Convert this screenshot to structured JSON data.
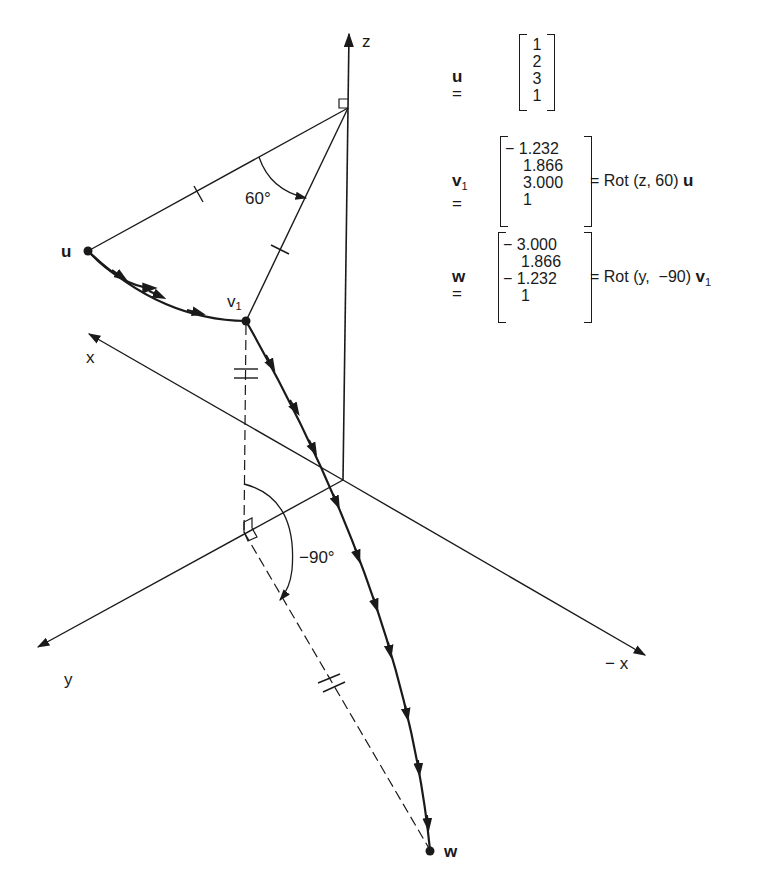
{
  "diagram": {
    "axes": {
      "z_label": "z",
      "x_label": "x",
      "neg_x_label": "− x",
      "y_label": "y"
    },
    "points": {
      "u_label": "u",
      "v1_label": "v",
      "v1_sub": "1",
      "w_label": "w"
    },
    "angles": {
      "rot_z": "60°",
      "rot_y": "−90°"
    },
    "colors": {
      "ink": "#1a1a1a",
      "background": "#ffffff"
    }
  },
  "equations": {
    "u": {
      "name": "u",
      "equals": "=",
      "values": [
        "1",
        "2",
        "3",
        "1"
      ]
    },
    "v1": {
      "name": "v",
      "sub": "1",
      "equals": "=",
      "values": [
        "− 1.232",
        "1.866",
        "3.000",
        "1"
      ],
      "rhs_prefix": "= Rot (z, 60) ",
      "rhs_vec": "u"
    },
    "w": {
      "name": "w",
      "equals": "=",
      "values": [
        "− 3.000",
        "1.866",
        "− 1.232",
        "1"
      ],
      "rhs_prefix": "= Rot (y,  −90) ",
      "rhs_vec": "v",
      "rhs_sub": "1"
    }
  }
}
